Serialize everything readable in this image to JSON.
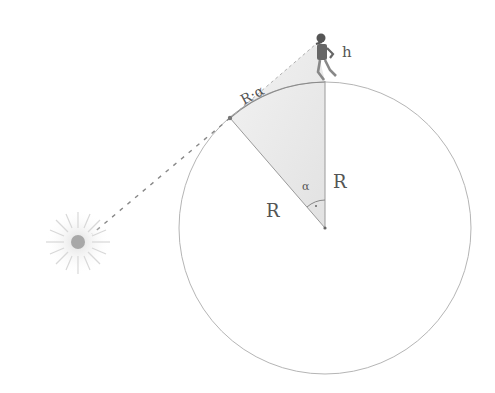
{
  "diagram": {
    "labels": {
      "arc": "R·α",
      "height": "h",
      "radius_left": "R",
      "radius_right": "R",
      "angle": "α"
    },
    "elements": {
      "sphere": {
        "cx": 325,
        "cy": 228,
        "r": 146
      },
      "center_point": {
        "x": 325,
        "y": 228
      },
      "tangent_point": {
        "x": 230,
        "y": 118
      },
      "top_point": {
        "x": 325,
        "y": 81
      },
      "observer_eye": {
        "x": 316,
        "y": 44
      },
      "sun": {
        "x": 78,
        "y": 242
      }
    },
    "colors": {
      "line": "#9a9a9a",
      "shade": "#e6e6e6",
      "text": "#555555"
    }
  }
}
